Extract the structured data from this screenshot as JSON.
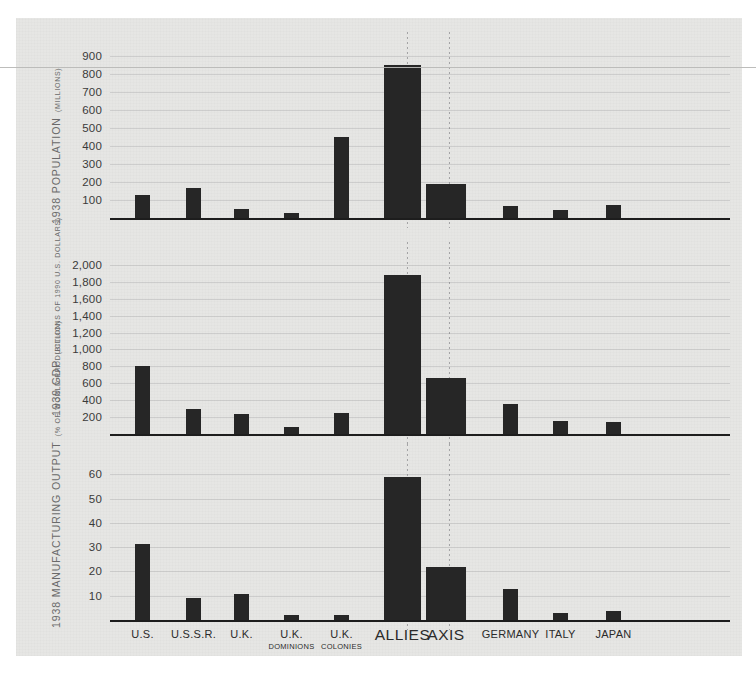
{
  "chart_data": [
    {
      "type": "bar",
      "title": "1938 POPULATION",
      "subtitle": "(MILLIONS)",
      "xlabel": "",
      "ylabel": "1938 POPULATION (MILLIONS)",
      "ylim": [
        0,
        950
      ],
      "yticks": [
        "100",
        "200",
        "300",
        "400",
        "500",
        "600",
        "700",
        "800",
        "900"
      ],
      "grid": true,
      "categories": [
        "U.S.",
        "U.S.S.R.",
        "U.K.",
        "U.K. DOMINIONS",
        "U.K. COLONIES",
        "ALLIES",
        "AXIS",
        "GERMANY",
        "ITALY",
        "JAPAN"
      ],
      "values": [
        130,
        167,
        48,
        30,
        450,
        850,
        190,
        69,
        44,
        72
      ]
    },
    {
      "type": "bar",
      "title": "1939 GDP",
      "subtitle": "(BILLIONS OF 1990 U.S. DOLLARS)",
      "xlabel": "",
      "ylabel": "1939 GDP (BILLIONS OF 1990 U.S. DOLLARS)",
      "ylim": [
        0,
        2100
      ],
      "yticks": [
        "200",
        "400",
        "600",
        "800",
        "1,000",
        "1,200",
        "1,400",
        "1,600",
        "1,800",
        "2,000"
      ],
      "grid": true,
      "categories": [
        "U.S.",
        "U.S.S.R.",
        "U.K.",
        "U.K. DOMINIONS",
        "U.K. COLONIES",
        "ALLIES",
        "AXIS",
        "GERMANY",
        "ITALY",
        "JAPAN"
      ],
      "values": [
        800,
        300,
        240,
        80,
        250,
        1880,
        660,
        350,
        150,
        140
      ]
    },
    {
      "type": "bar",
      "title": "1938 MANUFACTURING OUTPUT",
      "subtitle": "(% OF WORLD PRODUCTION)",
      "xlabel": "",
      "ylabel": "1938 MANUFACTURING OUTPUT (% OF WORLD PRODUCTION)",
      "ylim": [
        0,
        66
      ],
      "yticks": [
        "10",
        "20",
        "30",
        "40",
        "50",
        "60"
      ],
      "grid": true,
      "categories": [
        "U.S.",
        "U.S.S.R.",
        "U.K.",
        "U.K. DOMINIONS",
        "U.K. COLONIES",
        "ALLIES",
        "AXIS",
        "GERMANY",
        "ITALY",
        "JAPAN"
      ],
      "values": [
        31.4,
        9.0,
        10.7,
        2.0,
        2.0,
        59.0,
        22.0,
        12.7,
        2.7,
        3.8
      ]
    }
  ],
  "axis": {
    "categories": [
      {
        "line1": "U.S.",
        "line2": ""
      },
      {
        "line1": "U.S.S.R.",
        "line2": ""
      },
      {
        "line1": "U.K.",
        "line2": ""
      },
      {
        "line1": "U.K.",
        "line2": "DOMINIONS"
      },
      {
        "line1": "U.K.",
        "line2": "COLONIES"
      },
      {
        "line1": "ALLIES",
        "line2": ""
      },
      {
        "line1": "AXIS",
        "line2": ""
      },
      {
        "line1": "GERMANY",
        "line2": ""
      },
      {
        "line1": "ITALY",
        "line2": ""
      },
      {
        "line1": "JAPAN",
        "line2": ""
      }
    ]
  },
  "panels": [
    {
      "axis_title": "1938 POPULATION",
      "axis_units": "(MILLIONS)"
    },
    {
      "axis_title": "1939 GDP",
      "axis_units": "(BILLIONS OF 1990 U.S. DOLLARS)"
    },
    {
      "axis_title": "1938 MANUFACTURING OUTPUT",
      "axis_units": "(% OF WORLD PRODUCTION)"
    }
  ],
  "colors": {
    "bar": "#262626",
    "paper": "#e6e6e4",
    "axis": "#1d1d1d",
    "grid": "#9a9a9e",
    "label": "#6a6a6a"
  }
}
